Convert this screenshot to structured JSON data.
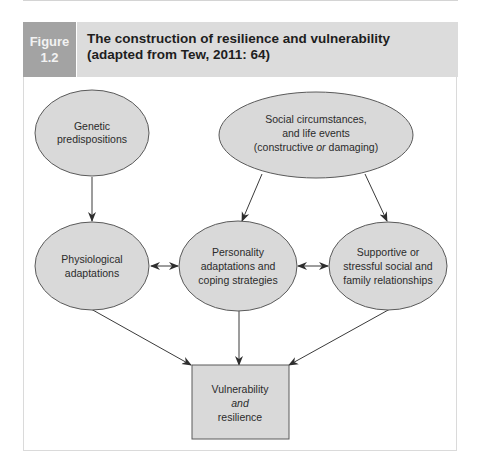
{
  "figure": {
    "label_line1": "Figure",
    "label_line2": "1.2",
    "title": "The construction of resilience and vulnerability (adapted from Tew, 2011: 64)"
  },
  "colors": {
    "label_bg": "#a3a3a3",
    "title_bg": "#dcdcdc",
    "node_fill": "#d9d9d9",
    "node_stroke": "#5a5a5a",
    "arrow": "#3a3a3a"
  },
  "nodes": {
    "genetic": {
      "shape": "ellipse",
      "lines": [
        "Genetic",
        "predispositions"
      ]
    },
    "social": {
      "shape": "ellipse",
      "lines": [
        "Social circumstances,",
        "and life events",
        "(constructive ",
        "or",
        " damaging)"
      ]
    },
    "physiological": {
      "shape": "ellipse",
      "lines": [
        "Physiological",
        "adaptations"
      ]
    },
    "personality": {
      "shape": "ellipse",
      "lines": [
        "Personality",
        "adaptations and",
        "coping strategies"
      ]
    },
    "supportive": {
      "shape": "ellipse",
      "lines": [
        "Supportive or",
        "stressful social and",
        "family relationships"
      ]
    },
    "outcome": {
      "shape": "rectangle",
      "lines": [
        "Vulnerability",
        "and",
        "resilience"
      ]
    }
  },
  "edges": [
    {
      "from": "genetic",
      "to": "physiological",
      "type": "directed"
    },
    {
      "from": "social",
      "to": "personality",
      "type": "directed"
    },
    {
      "from": "social",
      "to": "supportive",
      "type": "directed"
    },
    {
      "from": "physiological",
      "to": "personality",
      "type": "bidirectional"
    },
    {
      "from": "personality",
      "to": "supportive",
      "type": "bidirectional"
    },
    {
      "from": "physiological",
      "to": "outcome",
      "type": "directed"
    },
    {
      "from": "personality",
      "to": "outcome",
      "type": "directed"
    },
    {
      "from": "supportive",
      "to": "outcome",
      "type": "directed"
    }
  ]
}
